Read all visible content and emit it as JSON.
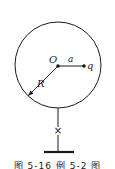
{
  "diagram": {
    "labels": {
      "center": "O",
      "distance": "a",
      "charge": "q",
      "radius": "R",
      "switch": "×"
    },
    "caption": "图 5-16  例 5-2 图",
    "colors": {
      "stroke": "#1a1a1a",
      "background": "#ffffff"
    }
  }
}
